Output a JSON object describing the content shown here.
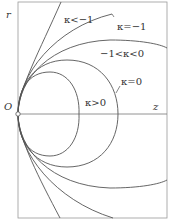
{
  "diagram": {
    "axes": {
      "vertical_label": "r",
      "horizontal_label": "z",
      "origin_label": "O"
    },
    "curves": [
      {
        "id": "kappa-lt-minus1",
        "label": "κ<−1",
        "type": "hyperbola"
      },
      {
        "id": "kappa-eq-minus1",
        "label": "κ=−1",
        "type": "parabola"
      },
      {
        "id": "kappa-between",
        "label": "−1<κ<0",
        "type": "prolate ellipse"
      },
      {
        "id": "kappa-eq-0",
        "label": "κ=0",
        "type": "sphere"
      },
      {
        "id": "kappa-gt-0",
        "label": "κ>0",
        "type": "oblate ellipse"
      }
    ],
    "colors": {
      "line": "#555555",
      "frame": "#888888",
      "background": "#ffffff"
    }
  }
}
